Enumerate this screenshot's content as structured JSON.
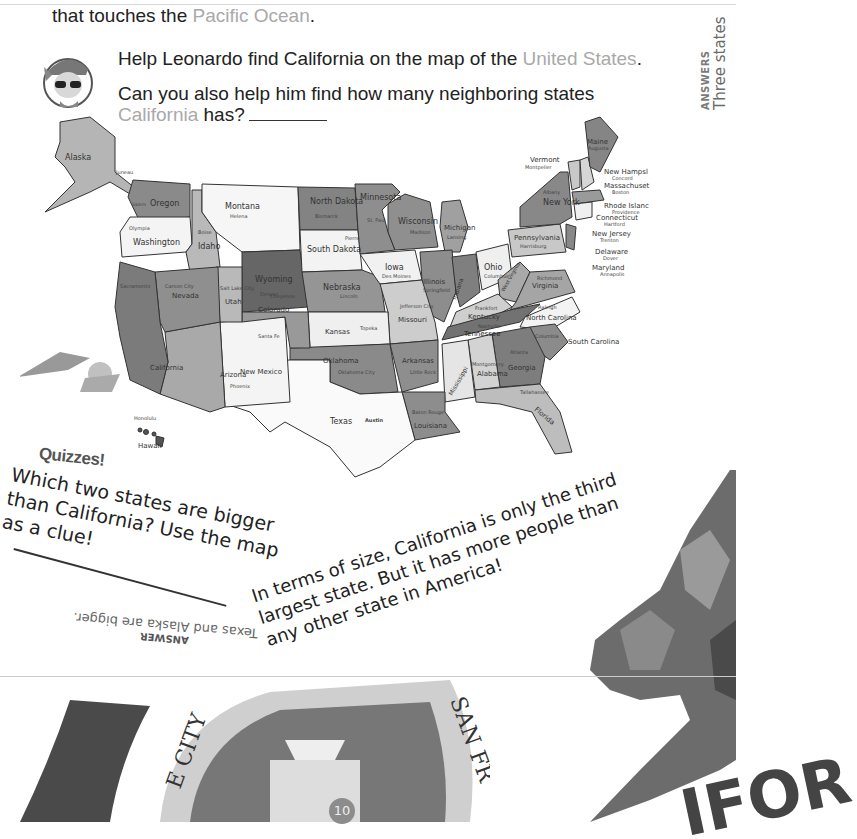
{
  "intro": {
    "line1_partial": "… biggest border is its coastline",
    "line2_prefix": "that touches the ",
    "line2_highlight": "Pacific Ocean",
    "line2_suffix": "."
  },
  "prompt": {
    "help_prefix": "Help Leonardo find California on the map of the ",
    "help_highlight": "United States",
    "help_suffix": ".",
    "question_line1": "Can you also help him find how many neighboring states",
    "question_highlight": "California",
    "question_suffix": " has?"
  },
  "side_answer": {
    "label": "ANSWERS",
    "text": "Three states"
  },
  "map": {
    "title": "Map of the United States",
    "states": [
      {
        "name": "Alaska",
        "capital": "Juneau"
      },
      {
        "name": "Washington",
        "capital": "Olympia"
      },
      {
        "name": "Oregon",
        "capital": "Salem"
      },
      {
        "name": "California",
        "capital": "Sacramento"
      },
      {
        "name": "Nevada",
        "capital": "Carson City"
      },
      {
        "name": "Idaho",
        "capital": "Boise"
      },
      {
        "name": "Montana",
        "capital": "Helena"
      },
      {
        "name": "Wyoming",
        "capital": "Cheyenne"
      },
      {
        "name": "Utah",
        "capital": "Salt Lake City"
      },
      {
        "name": "Colorado",
        "capital": "Denver"
      },
      {
        "name": "Arizona",
        "capital": "Phoenix"
      },
      {
        "name": "New Mexico",
        "capital": "Santa Fe"
      },
      {
        "name": "North Dakota",
        "capital": "Bismarck"
      },
      {
        "name": "South Dakota",
        "capital": "Pierre"
      },
      {
        "name": "Nebraska",
        "capital": "Lincoln"
      },
      {
        "name": "Kansas",
        "capital": "Topeka"
      },
      {
        "name": "Oklahoma",
        "capital": "Oklahoma City"
      },
      {
        "name": "Texas",
        "capital": "Austin"
      },
      {
        "name": "Minnesota",
        "capital": "St. Paul"
      },
      {
        "name": "Iowa",
        "capital": "Des Moines"
      },
      {
        "name": "Missouri",
        "capital": "Jefferson City"
      },
      {
        "name": "Arkansas",
        "capital": "Little Rock"
      },
      {
        "name": "Louisiana",
        "capital": "Baton Rouge"
      },
      {
        "name": "Wisconsin",
        "capital": "Madison"
      },
      {
        "name": "Illinois",
        "capital": "Springfield"
      },
      {
        "name": "Michigan",
        "capital": "Lansing"
      },
      {
        "name": "Indiana",
        "capital": "Indianapolis"
      },
      {
        "name": "Ohio",
        "capital": "Columbus"
      },
      {
        "name": "Kentucky",
        "capital": "Frankfort"
      },
      {
        "name": "Tennessee",
        "capital": "Nashville"
      },
      {
        "name": "Mississippi",
        "capital": "Jackson"
      },
      {
        "name": "Alabama",
        "capital": "Montgomery"
      },
      {
        "name": "Georgia",
        "capital": "Atlanta"
      },
      {
        "name": "Florida",
        "capital": "Tallahassee"
      },
      {
        "name": "South Carolina",
        "capital": "Columbia"
      },
      {
        "name": "North Carolina",
        "capital": "Raleigh"
      },
      {
        "name": "Virginia",
        "capital": "Richmond"
      },
      {
        "name": "West Virginia",
        "capital": "Charleston"
      },
      {
        "name": "Pennsylvania",
        "capital": "Harrisburg"
      },
      {
        "name": "New York",
        "capital": "Albany"
      },
      {
        "name": "Vermont",
        "capital": "Montpelier"
      },
      {
        "name": "New Hampshire",
        "capital": "Concord"
      },
      {
        "name": "Maine",
        "capital": "Augusta"
      },
      {
        "name": "Massachusetts",
        "capital": "Boston"
      },
      {
        "name": "Rhode Island",
        "capital": "Providence"
      },
      {
        "name": "Connecticut",
        "capital": "Hartford"
      },
      {
        "name": "New Jersey",
        "capital": "Trenton"
      },
      {
        "name": "Delaware",
        "capital": "Dover"
      },
      {
        "name": "Maryland",
        "capital": "Annapolis"
      },
      {
        "name": "Hawaii",
        "capital": "Honolulu"
      }
    ],
    "callout_labels": {
      "new_hampshire": "New Hampsl",
      "massachusetts": "Massachuset",
      "rhode_island": "Rhode Islanc",
      "connecticut": "Connecticut",
      "new_jersey": "New Jersey",
      "delaware": "Delaware",
      "maryland": "Maryland"
    }
  },
  "quiz": {
    "heading": "Quizzes!",
    "question": "Which two states are bigger than California? Use the map as a clue!",
    "answer_label": "ANSWER",
    "answer_text": "Texas and Alaska are bigger."
  },
  "fact": {
    "text": "In terms of size, California is only the third largest state. But it has more people than any other state in America!"
  },
  "seal": {
    "text_left": "E CITY",
    "text_right": "SAN FR"
  },
  "flag": {
    "text": "IFOR"
  },
  "page": {
    "number": "10"
  }
}
